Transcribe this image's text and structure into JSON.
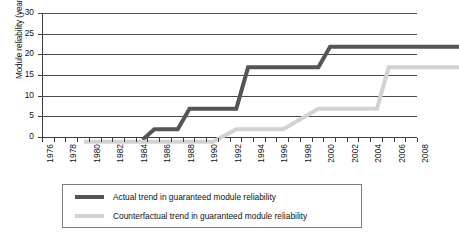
{
  "chart_data": {
    "type": "line",
    "title": "",
    "xlabel": "",
    "ylabel": "Module reliability (years)",
    "ylim": [
      0,
      30
    ],
    "ytick_step": 5,
    "yticks": [
      0,
      5,
      10,
      15,
      20,
      25,
      30
    ],
    "xlim": [
      1976,
      2008
    ],
    "xticks": [
      1976,
      1978,
      1980,
      1982,
      1984,
      1986,
      1988,
      1990,
      1992,
      1994,
      1996,
      1998,
      2000,
      2002,
      2004,
      2006,
      2008
    ],
    "xtick_labels": [
      "1976",
      "1978",
      "1980",
      "1982",
      "1984",
      "1986",
      "1988",
      "1990",
      "1992",
      "1994",
      "1996",
      "1998",
      "2000",
      "2002",
      "2004",
      "2006",
      "2008"
    ],
    "xtick_minor_every": 1,
    "grid": "horizontal",
    "legend_position": "below",
    "series": [
      {
        "name": "Actual trend in guaranteed module reliability",
        "color": "#555555",
        "linewidth": 4,
        "points": [
          {
            "x": 1981,
            "y": 2.5
          },
          {
            "x": 1982,
            "y": 5
          },
          {
            "x": 1984,
            "y": 5
          },
          {
            "x": 1985,
            "y": 10
          },
          {
            "x": 1989,
            "y": 10
          },
          {
            "x": 1990,
            "y": 20
          },
          {
            "x": 1996,
            "y": 20
          },
          {
            "x": 1997,
            "y": 25
          },
          {
            "x": 2008,
            "y": 25
          }
        ]
      },
      {
        "name": "Counterfactual trend in guaranteed module reliability",
        "color": "#d2d2d2",
        "linewidth": 4,
        "points": [
          {
            "x": 1976,
            "y": 2
          },
          {
            "x": 1987,
            "y": 2
          },
          {
            "x": 1989,
            "y": 5
          },
          {
            "x": 1993,
            "y": 5
          },
          {
            "x": 1996,
            "y": 10
          },
          {
            "x": 2001,
            "y": 10
          },
          {
            "x": 2002,
            "y": 20
          },
          {
            "x": 2008,
            "y": 20
          }
        ]
      }
    ]
  },
  "legend": {
    "entries": [
      {
        "label": "Actual trend in guaranteed module reliability"
      },
      {
        "label": "Counterfactual trend in guaranteed module reliability"
      }
    ]
  }
}
